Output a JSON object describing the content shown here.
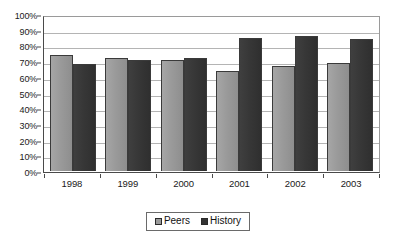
{
  "chart_data": {
    "type": "bar",
    "title": "",
    "subtitle": "",
    "xlabel": "",
    "ylabel": "",
    "categories": [
      "1998",
      "1999",
      "2000",
      "2001",
      "2002",
      "2003"
    ],
    "series": [
      {
        "name": "Peers",
        "color": "#9a9a9a",
        "values": [
          74,
          72,
          71,
          64,
          67,
          69
        ]
      },
      {
        "name": "History",
        "color": "#333333",
        "values": [
          68,
          71,
          72,
          85,
          86,
          84
        ]
      }
    ],
    "ylim": [
      0,
      100
    ],
    "ytick_values": [
      100,
      90,
      80,
      70,
      60,
      50,
      40,
      30,
      20,
      10,
      0
    ],
    "ytick_labels": [
      "100%",
      "90%",
      "80%",
      "70%",
      "60%",
      "50%",
      "40%",
      "30%",
      "20%",
      "10%",
      "0%"
    ],
    "grid": true,
    "grid_axis": "y",
    "legend_position": "bottom",
    "value_suffix": "%"
  },
  "legend": {
    "entries": [
      {
        "label": "Peers"
      },
      {
        "label": "History"
      }
    ]
  },
  "colors": {
    "peers": "#9a9a9a",
    "history": "#333333",
    "grid": "#b4b4b4",
    "axis": "#4a4a4a",
    "background": "#ffffff",
    "text": "#1a1a1a"
  }
}
